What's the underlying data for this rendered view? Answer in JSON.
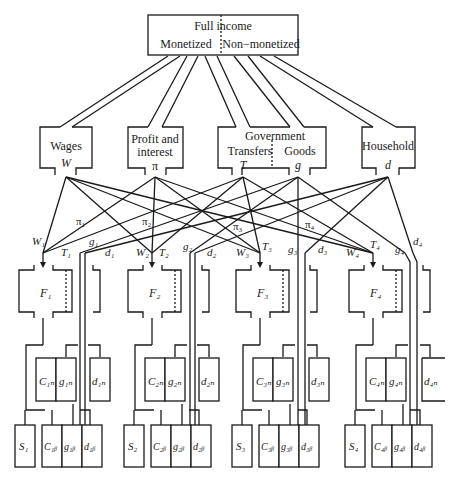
{
  "diagram": {
    "root": {
      "title": "Full income",
      "left_label": "Monetized",
      "right_label": "Non−monetized"
    },
    "sources": [
      {
        "label_line1": "Wages",
        "label_line2": "",
        "symbol": "W"
      },
      {
        "label_line1": "Profit and",
        "label_line2": "interest",
        "symbol": "π"
      },
      {
        "label_line1": "Government",
        "left_label": "Transfers",
        "right_label": "Goods",
        "symbol_left": "T",
        "symbol_right": "g"
      },
      {
        "label_line1": "Household",
        "label_line2": "",
        "symbol": "d"
      }
    ],
    "flow_labels": {
      "pi": [
        "π₁",
        "π₂",
        "π₃",
        "π₄"
      ],
      "W": [
        "W₁",
        "W₂",
        "W₃",
        "W₄"
      ],
      "T": [
        "T₁",
        "T₂",
        "T₃",
        "T₄"
      ],
      "g": [
        "g₁",
        "g₂",
        "g₃",
        "g₄"
      ],
      "d": [
        "d₁",
        "d₂",
        "d₃",
        "d₄"
      ]
    },
    "families": [
      {
        "F": "F₁",
        "Cn": "C₁ₙ",
        "gn": "g₁ₙ",
        "dn": "d₁ₙ",
        "S": "S₁",
        "Cb": "C₁ᵦ",
        "gb": "g₁ᵦ",
        "db": "d₁ᵦ"
      },
      {
        "F": "F₂",
        "Cn": "C₂ₙ",
        "gn": "g₂ₙ",
        "dn": "d₂ₙ",
        "S": "S₂",
        "Cb": "C₂ᵦ",
        "gb": "g₂ᵦ",
        "db": "d₂ᵦ"
      },
      {
        "F": "F₃",
        "Cn": "C₃ₙ",
        "gn": "g₃ₙ",
        "dn": "d₃ₙ",
        "S": "S₃",
        "Cb": "C₃ᵦ",
        "gb": "g₃ᵦ",
        "db": "d₃ᵦ"
      },
      {
        "F": "F₄",
        "Cn": "C₄ₙ",
        "gn": "g₄ₙ",
        "dn": "d₄ₙ",
        "S": "S₄",
        "Cb": "C₄ᵦ",
        "gb": "g₄ᵦ",
        "db": "d₄ᵦ"
      }
    ]
  }
}
